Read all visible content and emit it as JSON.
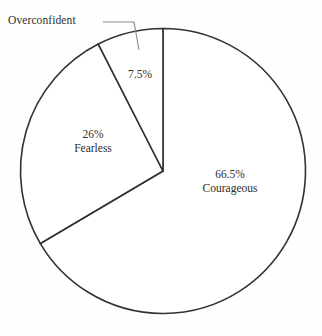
{
  "chart_data": {
    "type": "pie",
    "title": "",
    "subtitle": "",
    "xlabel": "",
    "ylabel": "",
    "legend_position": "none",
    "grid": false,
    "units": "percent",
    "total": 100,
    "start_angle_deg": 0,
    "direction": "clockwise",
    "categories": [
      "Courageous",
      "Fearless",
      "Overconfident"
    ],
    "values": [
      66.5,
      26,
      7.5
    ],
    "slices": [
      {
        "name": "Courageous",
        "value": 66.5,
        "value_label": "66.5%",
        "name_label": "Courageous",
        "label_placement": "inside",
        "sweep_deg": 239.4,
        "fill": "#ffffff",
        "stroke": "#33332c"
      },
      {
        "name": "Fearless",
        "value": 26,
        "value_label": "26%",
        "name_label": "Fearless",
        "label_placement": "inside",
        "sweep_deg": 93.6,
        "fill": "#ffffff",
        "stroke": "#33332c"
      },
      {
        "name": "Overconfident",
        "value": 7.5,
        "value_label": "7.5%",
        "name_label": "Overconfident",
        "label_placement": "outside-leader",
        "sweep_deg": 27,
        "fill": "#ffffff",
        "stroke": "#33332c"
      }
    ],
    "annotations": [
      {
        "name": "overconfident-leader",
        "text": "Overconfident",
        "points": "103,22 134,22 139,50"
      }
    ]
  },
  "colors": {
    "background": "#fefefe",
    "outline": "#33332c",
    "leader": "#8a8a82",
    "text": "#2e2e28"
  },
  "geometry": {
    "center_x": 163,
    "center_y": 171,
    "radius": 142.5
  }
}
